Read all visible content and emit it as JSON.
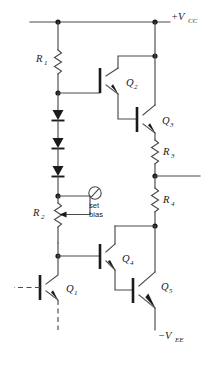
{
  "diagram": {
    "type": "schematic",
    "colors": {
      "wire": "#4a4a4a",
      "device": "#1a1a1a",
      "background": "#ffffff"
    }
  },
  "rails": {
    "positive": {
      "label": "+V",
      "subscript": "CC",
      "name": "vcc-rail"
    },
    "negative": {
      "label": "−V",
      "subscript": "EE",
      "name": "vee-rail"
    }
  },
  "resistors": [
    {
      "id": "R1",
      "label": "R",
      "subscript": "1"
    },
    {
      "id": "R2",
      "label": "R",
      "subscript": "2"
    },
    {
      "id": "R3",
      "label": "R",
      "subscript": "3"
    },
    {
      "id": "R4",
      "label": "R",
      "subscript": "4"
    }
  ],
  "transistors": [
    {
      "id": "Q1",
      "label": "Q",
      "subscript": "1"
    },
    {
      "id": "Q2",
      "label": "Q",
      "subscript": "2"
    },
    {
      "id": "Q3",
      "label": "Q",
      "subscript": "3"
    },
    {
      "id": "Q4",
      "label": "Q",
      "subscript": "4"
    },
    {
      "id": "Q5",
      "label": "Q",
      "subscript": "5"
    }
  ],
  "annotations": {
    "set_bias_line1": "set",
    "set_bias_line2": "bias"
  },
  "diodes": {
    "count": 3,
    "orientation": "cathode-down"
  }
}
